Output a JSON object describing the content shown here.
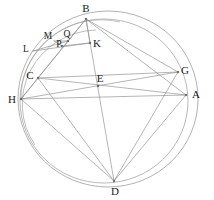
{
  "figure": {
    "kind": "geometry-diagram",
    "width": 214,
    "height": 200,
    "background_color": "#ffffff",
    "stroke_color": "#8c8c8c",
    "stroke_color_light": "#a8a8a8",
    "label_color": "#1a1a1a",
    "stroke_width": 0.6
  },
  "circles": [
    {
      "name": "outer-circle",
      "cx": 108,
      "cy": 99,
      "r": 90,
      "ry": 88
    },
    {
      "name": "inner-circle",
      "cx": 104,
      "cy": 101,
      "r": 84,
      "ry": 82
    },
    {
      "name": "small-arc-circle",
      "cx": 96,
      "cy": 106,
      "r": 76,
      "ry": 74
    }
  ],
  "points": [
    {
      "id": "A",
      "label": "A",
      "x": 186,
      "y": 95,
      "label_x": 196,
      "label_y": 94,
      "dot": true
    },
    {
      "id": "B",
      "label": "B",
      "x": 86,
      "y": 19,
      "label_x": 86,
      "label_y": 8,
      "dot": true
    },
    {
      "id": "C",
      "label": "C",
      "x": 38,
      "y": 78,
      "label_x": 30,
      "label_y": 75,
      "dot": true
    },
    {
      "id": "D",
      "label": "D",
      "x": 114,
      "y": 181,
      "label_x": 115,
      "label_y": 191,
      "dot": true
    },
    {
      "id": "E",
      "label": "E",
      "x": 98,
      "y": 86,
      "label_x": 100,
      "label_y": 78,
      "dot": true
    },
    {
      "id": "G",
      "label": "G",
      "x": 178,
      "y": 72,
      "label_x": 185,
      "label_y": 70,
      "dot": true
    },
    {
      "id": "H",
      "label": "H",
      "x": 21,
      "y": 99,
      "label_x": 12,
      "label_y": 99,
      "dot": true
    },
    {
      "id": "K",
      "label": "K",
      "x": 90,
      "y": 43,
      "label_x": 97,
      "label_y": 43,
      "dot": true
    },
    {
      "id": "L",
      "label": "L",
      "x": 33,
      "y": 51,
      "label_x": 26,
      "label_y": 50,
      "dot": false
    },
    {
      "id": "M",
      "label": "M",
      "x": 54,
      "y": 41,
      "label_x": 48,
      "label_y": 37,
      "dot": false
    },
    {
      "id": "P",
      "label": "P",
      "x": 62,
      "y": 46,
      "label_x": 59,
      "label_y": 44,
      "dot": true
    },
    {
      "id": "Q",
      "label": "Q",
      "x": 68,
      "y": 41,
      "label_x": 67,
      "label_y": 35,
      "dot": true
    }
  ],
  "segments": [
    {
      "name": "segment-B-D",
      "from": "B",
      "to": "D"
    },
    {
      "name": "segment-B-C",
      "from": "B",
      "to": "C"
    },
    {
      "name": "segment-B-G",
      "from": "B",
      "to": "G"
    },
    {
      "name": "segment-B-A",
      "from": "B",
      "to": "A"
    },
    {
      "name": "segment-B-H",
      "from": "B",
      "to": "H"
    },
    {
      "name": "segment-B-K",
      "from": "B",
      "to": "K"
    },
    {
      "name": "segment-C-G",
      "from": "C",
      "to": "G"
    },
    {
      "name": "segment-C-D",
      "from": "C",
      "to": "D"
    },
    {
      "name": "segment-C-H",
      "from": "C",
      "to": "H"
    },
    {
      "name": "segment-C-A",
      "from": "C",
      "to": "A"
    },
    {
      "name": "segment-H-A",
      "from": "H",
      "to": "A"
    },
    {
      "name": "segment-H-D",
      "from": "H",
      "to": "D"
    },
    {
      "name": "segment-H-G",
      "from": "H",
      "to": "G"
    },
    {
      "name": "segment-G-D",
      "from": "G",
      "to": "D"
    },
    {
      "name": "segment-A-D",
      "from": "A",
      "to": "D"
    },
    {
      "name": "segment-L-K",
      "from": "L",
      "to": "K"
    },
    {
      "name": "segment-L-Q",
      "from": "L",
      "to": "Q"
    },
    {
      "name": "segment-M-Q",
      "from": "M",
      "to": "Q"
    },
    {
      "name": "segment-P-K",
      "from": "P",
      "to": "K"
    }
  ],
  "labels_order": [
    "B",
    "M",
    "Q",
    "K",
    "L",
    "C",
    "E",
    "G",
    "H",
    "A",
    "P",
    "D"
  ]
}
